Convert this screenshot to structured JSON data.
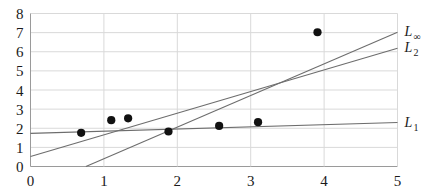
{
  "chart_data": {
    "type": "scatter",
    "title": "",
    "subtitle": "",
    "xlabel": "",
    "ylabel": "",
    "xlim": [
      0,
      5
    ],
    "ylim": [
      0,
      8
    ],
    "xticks": [
      "0",
      "1",
      "2",
      "3",
      "4",
      "5"
    ],
    "yticks": [
      "0",
      "1",
      "2",
      "3",
      "4",
      "5",
      "6",
      "7",
      "8"
    ],
    "grid": true,
    "legend_position": "right-inline",
    "point_color": "#111111",
    "line_color": "#6d6d6d",
    "grid_color": "#d9d9d9",
    "axis_color": "#9a9a9a",
    "points": [
      {
        "x": 0.69,
        "y": 1.76
      },
      {
        "x": 1.1,
        "y": 2.42
      },
      {
        "x": 1.33,
        "y": 2.52
      },
      {
        "x": 1.88,
        "y": 1.83
      },
      {
        "x": 2.57,
        "y": 2.12
      },
      {
        "x": 3.1,
        "y": 2.32
      },
      {
        "x": 3.91,
        "y": 7.02
      }
    ],
    "series": [
      {
        "name": "L_infinity",
        "label": "L",
        "sublabel": "∞",
        "kind": "line",
        "x": [
          0.755,
          5.0
        ],
        "values": [
          0.0,
          7.02
        ],
        "label_at": {
          "x": 5.0,
          "y": 7.02
        }
      },
      {
        "name": "L_2",
        "label": "L",
        "sublabel": "2",
        "kind": "line",
        "x": [
          0.0,
          5.0
        ],
        "values": [
          0.52,
          6.18
        ],
        "label_at": {
          "x": 5.0,
          "y": 6.18
        }
      },
      {
        "name": "L_1",
        "label": "L",
        "sublabel": "1",
        "kind": "line",
        "x": [
          0.0,
          5.0
        ],
        "values": [
          1.73,
          2.3
        ],
        "label_at": {
          "x": 5.0,
          "y": 2.3
        }
      }
    ]
  }
}
